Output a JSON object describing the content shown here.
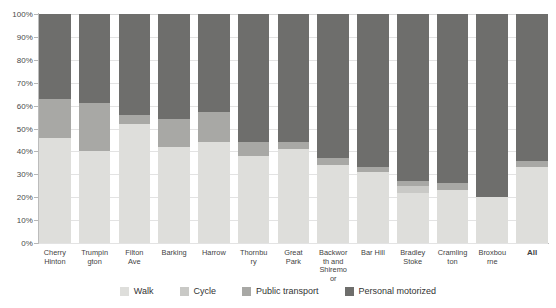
{
  "chart_data": {
    "type": "bar",
    "subtype": "stacked-bar-100-percent",
    "title": "",
    "subtitle": "",
    "xlabel": "",
    "ylabel": "",
    "ylim": [
      0,
      100
    ],
    "yunit": "%",
    "grid": true,
    "legend_position": "bottom",
    "stack_order_bottom_to_top": [
      "Walk",
      "Cycle",
      "Public transport",
      "Personal motorized"
    ],
    "ytick_labels": [
      "100%",
      "90%",
      "80%",
      "70%",
      "60%",
      "50%",
      "40%",
      "30%",
      "20%",
      "10%",
      "0%"
    ],
    "ytick_values": [
      100,
      90,
      80,
      70,
      60,
      50,
      40,
      30,
      20,
      10,
      0
    ],
    "categories": [
      "Cherry Hinton",
      "Trumpington",
      "Filton Ave",
      "Barking",
      "Harrow",
      "Thornbury",
      "Great Park",
      "Backworth and Shiremoor",
      "Bar Hill",
      "Bradley Stoke",
      "Cramlington",
      "Broxbourne",
      "All"
    ],
    "series": [
      {
        "name": "Walk",
        "color": "#dededb",
        "values": [
          46,
          40,
          52,
          42,
          44,
          38,
          41,
          34,
          31,
          22,
          23,
          20,
          33
        ]
      },
      {
        "name": "Cycle",
        "color": "#c9c9c6",
        "values": [
          0,
          0,
          0,
          0,
          0,
          0,
          0,
          0,
          0,
          3,
          0,
          0,
          0
        ]
      },
      {
        "name": "Public transport",
        "color": "#a8a8a5",
        "values": [
          17,
          21,
          4,
          12,
          13,
          6,
          3,
          3,
          2,
          2,
          3,
          0,
          3
        ]
      },
      {
        "name": "Personal motorized",
        "color": "#6e6e6c",
        "values": [
          37,
          39,
          44,
          46,
          43,
          56,
          56,
          63,
          67,
          73,
          74,
          80,
          64
        ]
      }
    ]
  },
  "legend": {
    "items": [
      {
        "label": "Walk",
        "color": "#dededb"
      },
      {
        "label": "Cycle",
        "color": "#c9c9c6"
      },
      {
        "label": "Public transport",
        "color": "#a8a8a5"
      },
      {
        "label": "Personal motorized",
        "color": "#6e6e6c"
      }
    ]
  },
  "axis": {
    "y_tick_labels": [
      "100%",
      "90%",
      "80%",
      "70%",
      "60%",
      "50%",
      "40%",
      "30%",
      "20%",
      "10%",
      "0%"
    ]
  }
}
